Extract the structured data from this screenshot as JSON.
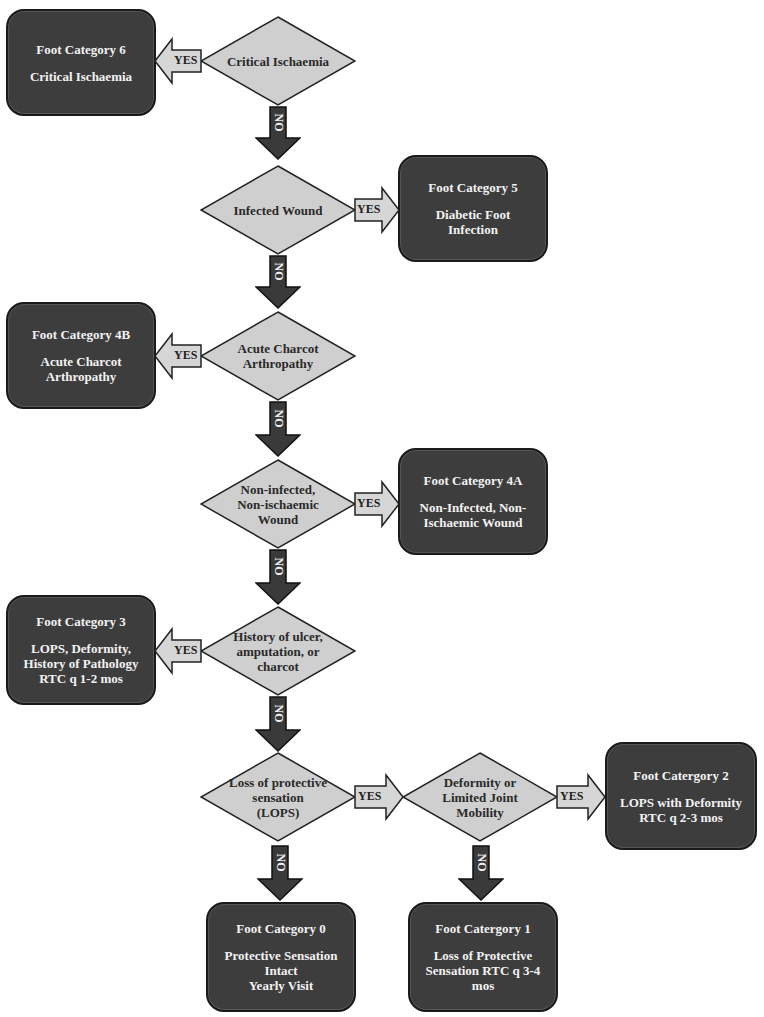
{
  "diagram": {
    "colors": {
      "category_box": "#3d3d3d",
      "decision_diamond": "#cfcfcf",
      "yes_arrow": "#d6d6d6",
      "no_arrow": "#3a3a3a",
      "box_text": "#f2f2f2"
    },
    "decisions": [
      {
        "id": "d1",
        "label": "Critical Ischaemia"
      },
      {
        "id": "d2",
        "label": "Infected Wound"
      },
      {
        "id": "d3",
        "label": "Acute Charcot\nArthropathy"
      },
      {
        "id": "d4",
        "label": "Non-infected,\nNon-ischaemic\nWound"
      },
      {
        "id": "d5",
        "label": "History of ulcer,\namputation, or\ncharcot"
      },
      {
        "id": "d6",
        "label": "Loss of protective\nsensation\n(LOPS)"
      },
      {
        "id": "d7",
        "label": "Deformity or\nLimited Joint\nMobility"
      }
    ],
    "categories": [
      {
        "id": "c6",
        "title": "Foot Category 6",
        "desc": "Critical Ischaemia"
      },
      {
        "id": "c5",
        "title": "Foot Category 5",
        "desc": "Diabetic Foot\nInfection"
      },
      {
        "id": "c4b",
        "title": "Foot Category 4B",
        "desc": "Acute Charcot\nArthropathy"
      },
      {
        "id": "c4a",
        "title": "Foot Category 4A",
        "desc": "Non-Infected, Non-\nIschaemic Wound"
      },
      {
        "id": "c3",
        "title": "Foot Category 3",
        "desc": "LOPS, Deformity,\nHistory of Pathology\nRTC q 1-2 mos"
      },
      {
        "id": "c2",
        "title": "Foot Catergory 2",
        "desc": "LOPS with Deformity\nRTC q 2-3 mos"
      },
      {
        "id": "c0",
        "title": "Foot Category 0",
        "desc": "Protective Sensation\nIntact\nYearly Visit"
      },
      {
        "id": "c1",
        "title": "Foot Catergory 1",
        "desc": "Loss of Protective\nSensation RTC q 3-4\nmos"
      }
    ],
    "arrow_labels": {
      "yes": "YES",
      "no": "NO"
    }
  }
}
